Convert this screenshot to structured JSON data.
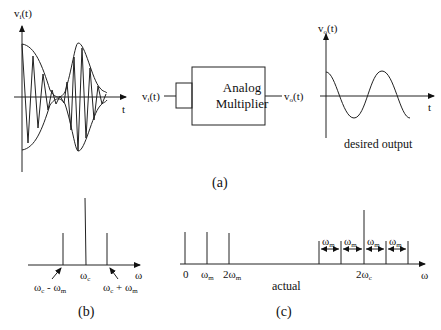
{
  "panel_a": {
    "caption": "(a)",
    "input_plot": {
      "ylabel": "v",
      "ylabel_sub": "i",
      "ylabel_suffix": "(t)",
      "xlabel": "t"
    },
    "block": {
      "line1": "Analog",
      "line2": "Multiplier",
      "input_label": "v",
      "input_sub": "i",
      "input_suffix": "(t)",
      "output_label": "v",
      "output_sub": "o",
      "output_suffix": "(t)"
    },
    "output_plot": {
      "ylabel": "v",
      "ylabel_sub": "o",
      "ylabel_suffix": "(t)",
      "xlabel": "t",
      "caption": "desired output"
    }
  },
  "panel_b": {
    "caption": "(b)",
    "axis_label": "ω",
    "lines": [
      {
        "label": "ωc - ωm",
        "height": "short"
      },
      {
        "label": "ωc",
        "height": "tall"
      },
      {
        "label": "ωc + ωm",
        "height": "short"
      }
    ],
    "label_left": "ω",
    "label_left_sub": "c",
    "label_left_mid": " - ω",
    "label_left_sub2": "m",
    "label_center": "ω",
    "label_center_sub": "c",
    "label_right": "ω",
    "label_right_sub": "c",
    "label_right_mid": " + ω",
    "label_right_sub2": "m"
  },
  "panel_c": {
    "caption": "(c)",
    "axis_label": "ω",
    "note": "actual",
    "low_lines": [
      {
        "label": "0"
      },
      {
        "label": "ωm"
      },
      {
        "label": "2ωm"
      }
    ],
    "tick0": "0",
    "tick1": "ω",
    "tick1_sub": "m",
    "tick2": "2ω",
    "tick2_sub": "m",
    "tick_center": "2ω",
    "tick_center_sub": "c",
    "spacing": [
      {
        "label": "ω",
        "sub": "m"
      },
      {
        "label": "ω",
        "sub": "m"
      },
      {
        "label": "ω",
        "sub": "m"
      },
      {
        "label": "ω",
        "sub": "m"
      }
    ]
  }
}
